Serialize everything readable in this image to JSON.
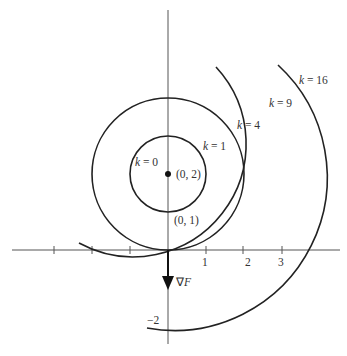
{
  "diagram": {
    "type": "level-curves",
    "center": {
      "x": 0,
      "y": 2,
      "label": "(0, 2)"
    },
    "point_label_below": "(0, 1)",
    "gradient_label": "∇F",
    "level_curves": [
      {
        "k": 0,
        "radius": 0,
        "label": "k = 0"
      },
      {
        "k": 1,
        "radius": 1,
        "label": "k = 1"
      },
      {
        "k": 4,
        "radius": 2,
        "label": "k = 4"
      },
      {
        "k": 9,
        "radius": 3,
        "label": "k = 9"
      },
      {
        "k": 16,
        "radius": 4,
        "label": "k = 16"
      }
    ],
    "x_ticks": [
      "1",
      "2",
      "3"
    ],
    "y_ticks": [
      "−2"
    ],
    "colors": {
      "curve": "#222222",
      "axis": "#555555",
      "text": "#333333"
    }
  }
}
